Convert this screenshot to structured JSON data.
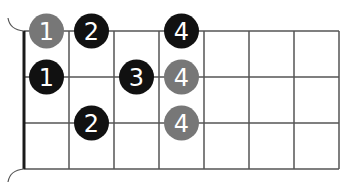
{
  "diagram": {
    "type": "fretboard-finger-chart",
    "strings": 4,
    "frets": 7,
    "colors": {
      "line": "#555555",
      "nut": "#1a1a1a",
      "dot_black": "#111111",
      "dot_gray": "#777777",
      "label": "#ffffff"
    },
    "dots": [
      {
        "string": 0,
        "fret": 1,
        "finger": "1",
        "color": "gray"
      },
      {
        "string": 0,
        "fret": 2,
        "finger": "2",
        "color": "black"
      },
      {
        "string": 0,
        "fret": 4,
        "finger": "4",
        "color": "black"
      },
      {
        "string": 1,
        "fret": 1,
        "finger": "1",
        "color": "black"
      },
      {
        "string": 1,
        "fret": 3,
        "finger": "3",
        "color": "black"
      },
      {
        "string": 1,
        "fret": 4,
        "finger": "4",
        "color": "gray"
      },
      {
        "string": 2,
        "fret": 2,
        "finger": "2",
        "color": "black"
      },
      {
        "string": 2,
        "fret": 4,
        "finger": "4",
        "color": "gray"
      }
    ]
  }
}
